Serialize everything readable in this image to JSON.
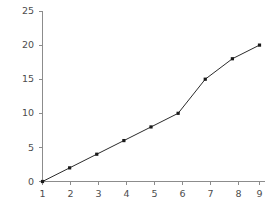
{
  "chart_data": {
    "type": "line",
    "title": "",
    "subtitle": "",
    "xlabel": "",
    "ylabel": "",
    "x": [
      1,
      2,
      3,
      4,
      5,
      6,
      7,
      8,
      9
    ],
    "values": [
      0,
      2,
      4,
      6,
      8,
      10,
      15,
      18,
      20
    ],
    "series": [
      {
        "name": "",
        "values": [
          0,
          2,
          4,
          6,
          8,
          10,
          15,
          18,
          20
        ]
      }
    ],
    "xlim": [
      0.6,
      9.6
    ],
    "ylim": [
      0,
      25
    ],
    "xticks": [
      1,
      2,
      3,
      4,
      5,
      6,
      7,
      8,
      9
    ],
    "yticks": [
      0,
      5,
      10,
      15,
      20,
      25
    ],
    "xtick_labels": [
      "1",
      "2",
      "3",
      "4",
      "5",
      "6",
      "7",
      "8",
      "9"
    ],
    "ytick_labels": [
      "0",
      "5",
      "10",
      "15",
      "20",
      "25"
    ],
    "grid": false,
    "legend": false,
    "legend_position": "none",
    "marker": "square",
    "colors": {
      "line": "#2b2b2b",
      "marker": "#1a1a1a",
      "axis": "#8c8c8c",
      "tick_text": "#4d4d4d",
      "background": "#ffffff"
    }
  }
}
